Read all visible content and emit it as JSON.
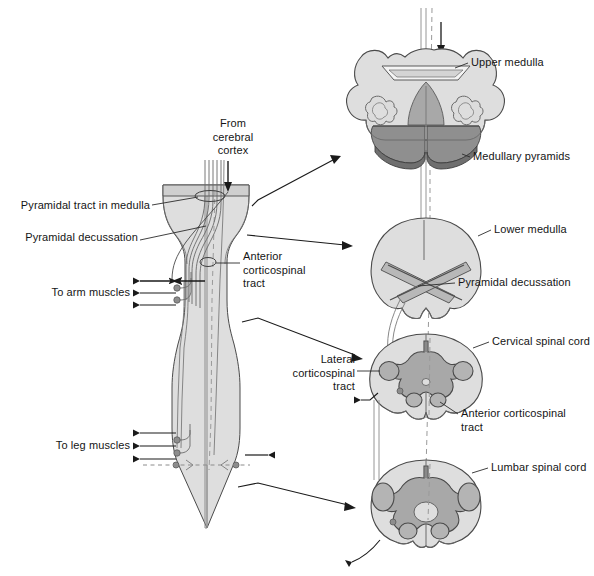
{
  "figure": {
    "type": "anatomical-diagram"
  },
  "colors": {
    "background": "#ffffff",
    "outline": "#3a3a3a",
    "body_light": "#dedede",
    "body_mid": "#c2c2c2",
    "gray_matter": "#a8a8a8",
    "pyramid_dark": "#8f8f8f",
    "pyramid_darker": "#707070",
    "tract_fill": "#b4b4b4",
    "text": "#151515",
    "midline_dash": "#9a9a9a"
  },
  "labels": {
    "from_cerebral_cortex": "From\ncerebral\ncortex",
    "pyramidal_tract_in_medulla": "Pyramidal tract in medulla",
    "pyramidal_decussation_left": "Pyramidal decussation",
    "anterior_corticospinal_tract_left": "Anterior\ncorticospinal\ntract",
    "to_arm_muscles": "To arm muscles",
    "to_leg_muscles": "To leg muscles",
    "lateral_corticospinal_tract": "Lateral\ncorticospinal\ntract",
    "upper_medulla": "Upper medulla",
    "medullary_pyramids": "Medullary pyramids",
    "lower_medulla": "Lower medulla",
    "pyramidal_decussation_right": "Pyramidal decussation",
    "cervical_spinal_cord": "Cervical spinal cord",
    "anterior_corticospinal_tract_right": "Anterior corticospinal\ntract",
    "lumbar_spinal_cord": "Lumbar spinal cord"
  },
  "sections": [
    {
      "id": "upper-medulla",
      "name": "Upper medulla",
      "order": 1
    },
    {
      "id": "lower-medulla",
      "name": "Lower medulla",
      "order": 2
    },
    {
      "id": "cervical-spinal-cord",
      "name": "Cervical spinal cord",
      "order": 3
    },
    {
      "id": "lumbar-spinal-cord",
      "name": "Lumbar spinal cord",
      "order": 4
    }
  ],
  "structures": {
    "longitudinal_view": "Brainstem and spinal cord longitudinal section",
    "arrow_from_cortex": "descending-arrow",
    "arm_output_arrows": 3,
    "leg_output_arrows": 3
  }
}
